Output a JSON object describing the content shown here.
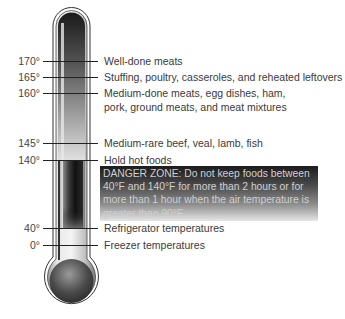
{
  "diagram": {
    "type": "thermometer-food-safety",
    "colors": {
      "tube_dark": "#1a1a1a",
      "tube_light": "#d9d9d9",
      "danger_zone_top": "#1c1c1c",
      "danger_zone_bottom": "#e6e6e6",
      "danger_text": "#cfcfcf",
      "label_text": "#3a3a3a"
    },
    "markers": [
      {
        "temp": "170°",
        "label": "Well-done meats"
      },
      {
        "temp": "165°",
        "label": "Stuffing, poultry, casseroles, and reheated leftovers"
      },
      {
        "temp": "160°",
        "label": "Medium-done meats, egg dishes, ham,",
        "label2": "pork, ground meats, and meat mixtures"
      },
      {
        "temp": "145°",
        "label": "Medium-rare beef, veal, lamb, fish"
      },
      {
        "temp": "140°",
        "label": "Hold hot foods"
      },
      {
        "temp": "40°",
        "label": "Refrigerator temperatures"
      },
      {
        "temp": "0°",
        "label": "Freezer temperatures"
      }
    ],
    "danger_zone": {
      "lines": [
        "DANGER ZONE: Do not keep foods between",
        "40°F and 140°F for more than 2 hours or for",
        "more than 1 hour when the air temperature is",
        "greater than 90°F."
      ]
    }
  }
}
